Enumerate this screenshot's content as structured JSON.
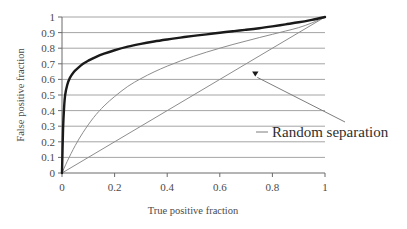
{
  "chart_data": {
    "type": "line",
    "title": "",
    "xlabel": "True positive fraction",
    "ylabel": "False positive fraction",
    "xlim": [
      0,
      1
    ],
    "ylim": [
      0,
      1
    ],
    "grid": true,
    "grid_orientation": "horizontal",
    "legend": false,
    "legend_position": "none",
    "xticks": [
      "0",
      "0.2",
      "0.4",
      "0.6",
      "0.8",
      "1"
    ],
    "xtick_values": [
      0,
      0.2,
      0.4,
      0.6,
      0.8,
      1
    ],
    "yticks": [
      "0",
      "0.1",
      "0.2",
      "0.3",
      "0.4",
      "0.5",
      "0.6",
      "0.7",
      "0.8",
      "0.9",
      "1"
    ],
    "ytick_values": [
      0,
      0.1,
      0.2,
      0.3,
      0.4,
      0.5,
      0.6,
      0.7,
      0.8,
      0.9,
      1
    ],
    "series": [
      {
        "name": "Excellent separation",
        "style": "bold-black",
        "color": "#1a1a1a",
        "x": [
          0,
          0.004,
          0.008,
          0.012,
          0.02,
          0.03,
          0.045,
          0.06,
          0.08,
          0.1,
          0.13,
          0.16,
          0.2,
          0.25,
          0.3,
          0.35,
          0.4,
          0.45,
          0.5,
          0.55,
          0.6,
          0.65,
          0.7,
          0.75,
          0.8,
          0.85,
          0.9,
          0.95,
          1
        ],
        "y": [
          0,
          0.28,
          0.42,
          0.5,
          0.565,
          0.61,
          0.648,
          0.672,
          0.7,
          0.72,
          0.745,
          0.765,
          0.787,
          0.81,
          0.828,
          0.843,
          0.856,
          0.868,
          0.879,
          0.889,
          0.899,
          0.909,
          0.918,
          0.928,
          0.94,
          0.953,
          0.966,
          0.982,
          1
        ]
      },
      {
        "name": "Moderate separation",
        "style": "thin-gray",
        "color": "#8d8d8d",
        "x": [
          0,
          0.02,
          0.05,
          0.08,
          0.12,
          0.16,
          0.2,
          0.25,
          0.3,
          0.35,
          0.4,
          0.45,
          0.5,
          0.55,
          0.6,
          0.65,
          0.7,
          0.75,
          0.8,
          0.85,
          0.9,
          0.95,
          1
        ],
        "y": [
          0,
          0.075,
          0.175,
          0.26,
          0.355,
          0.43,
          0.49,
          0.555,
          0.605,
          0.648,
          0.685,
          0.718,
          0.748,
          0.775,
          0.8,
          0.824,
          0.846,
          0.868,
          0.889,
          0.91,
          0.932,
          0.962,
          1
        ]
      },
      {
        "name": "Random separation",
        "style": "thin-gray-diagonal",
        "color": "#8d8d8d",
        "x": [
          0,
          1
        ],
        "y": [
          0,
          1
        ]
      }
    ],
    "annotations": [
      {
        "text": "Random separation",
        "points_to_x": 0.735,
        "points_to_y": 0.645,
        "arrow": true
      }
    ]
  },
  "axes": {
    "x_title": "True positive fraction",
    "y_title": "False positive fraction"
  }
}
